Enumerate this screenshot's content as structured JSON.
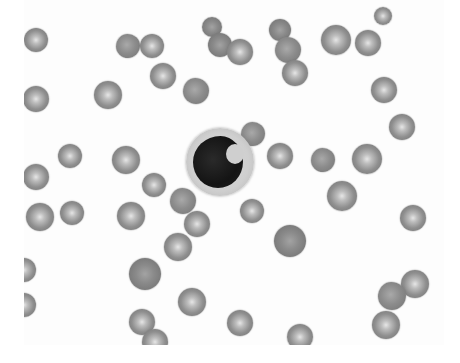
{
  "image": {
    "description": "Grayscale peripheral blood smear micrograph showing a central monocyte with kidney-shaped nucleus surrounded by red blood cells",
    "width": 460,
    "height": 363,
    "field": {
      "x": 24,
      "y": 0,
      "w": 420,
      "h": 345
    },
    "colors": {
      "background": "#ffffff",
      "rbc_mid": "#8f8f8f",
      "rbc_center": "#e6e6e6",
      "nucleus": "#141414",
      "cytoplasm": "#cfcfcf"
    }
  },
  "monocyte": {
    "cx": 220,
    "cy": 162,
    "r": 34
  },
  "red_blood_cells": [
    {
      "cx": 36,
      "cy": 40,
      "r": 12,
      "type": "normal"
    },
    {
      "cx": 128,
      "cy": 46,
      "r": 12,
      "type": "crenated"
    },
    {
      "cx": 152,
      "cy": 46,
      "r": 12,
      "type": "normal"
    },
    {
      "cx": 212,
      "cy": 27,
      "r": 10,
      "type": "dark"
    },
    {
      "cx": 220,
      "cy": 45,
      "r": 12,
      "type": "dark"
    },
    {
      "cx": 240,
      "cy": 52,
      "r": 13,
      "type": "normal"
    },
    {
      "cx": 280,
      "cy": 30,
      "r": 11,
      "type": "dark"
    },
    {
      "cx": 288,
      "cy": 50,
      "r": 13,
      "type": "crenated"
    },
    {
      "cx": 295,
      "cy": 73,
      "r": 13,
      "type": "normal"
    },
    {
      "cx": 336,
      "cy": 40,
      "r": 15,
      "type": "normal"
    },
    {
      "cx": 368,
      "cy": 43,
      "r": 13,
      "type": "normal"
    },
    {
      "cx": 384,
      "cy": 90,
      "r": 13,
      "type": "normal"
    },
    {
      "cx": 163,
      "cy": 76,
      "r": 13,
      "type": "normal"
    },
    {
      "cx": 196,
      "cy": 91,
      "r": 13,
      "type": "crenated"
    },
    {
      "cx": 108,
      "cy": 95,
      "r": 14,
      "type": "normal"
    },
    {
      "cx": 36,
      "cy": 99,
      "r": 13,
      "type": "normal"
    },
    {
      "cx": 402,
      "cy": 127,
      "r": 13,
      "type": "normal"
    },
    {
      "cx": 70,
      "cy": 156,
      "r": 12,
      "type": "normal"
    },
    {
      "cx": 126,
      "cy": 160,
      "r": 14,
      "type": "normal"
    },
    {
      "cx": 36,
      "cy": 177,
      "r": 13,
      "type": "normal"
    },
    {
      "cx": 253,
      "cy": 134,
      "r": 12,
      "type": "crenated"
    },
    {
      "cx": 280,
      "cy": 156,
      "r": 13,
      "type": "normal"
    },
    {
      "cx": 323,
      "cy": 160,
      "r": 12,
      "type": "crenated"
    },
    {
      "cx": 367,
      "cy": 159,
      "r": 15,
      "type": "normal"
    },
    {
      "cx": 154,
      "cy": 185,
      "r": 12,
      "type": "normal"
    },
    {
      "cx": 183,
      "cy": 201,
      "r": 13,
      "type": "crenated"
    },
    {
      "cx": 197,
      "cy": 224,
      "r": 13,
      "type": "normal"
    },
    {
      "cx": 342,
      "cy": 196,
      "r": 15,
      "type": "normal"
    },
    {
      "cx": 40,
      "cy": 217,
      "r": 14,
      "type": "normal"
    },
    {
      "cx": 72,
      "cy": 213,
      "r": 12,
      "type": "normal"
    },
    {
      "cx": 131,
      "cy": 216,
      "r": 14,
      "type": "normal"
    },
    {
      "cx": 252,
      "cy": 211,
      "r": 12,
      "type": "normal"
    },
    {
      "cx": 413,
      "cy": 218,
      "r": 13,
      "type": "normal"
    },
    {
      "cx": 178,
      "cy": 247,
      "r": 14,
      "type": "normal"
    },
    {
      "cx": 290,
      "cy": 241,
      "r": 16,
      "type": "dark"
    },
    {
      "cx": 24,
      "cy": 270,
      "r": 12,
      "type": "normal"
    },
    {
      "cx": 145,
      "cy": 274,
      "r": 16,
      "type": "dark"
    },
    {
      "cx": 415,
      "cy": 284,
      "r": 14,
      "type": "normal"
    },
    {
      "cx": 392,
      "cy": 296,
      "r": 14,
      "type": "crenated"
    },
    {
      "cx": 24,
      "cy": 305,
      "r": 12,
      "type": "normal"
    },
    {
      "cx": 192,
      "cy": 302,
      "r": 14,
      "type": "normal"
    },
    {
      "cx": 386,
      "cy": 325,
      "r": 14,
      "type": "normal"
    },
    {
      "cx": 142,
      "cy": 322,
      "r": 13,
      "type": "normal"
    },
    {
      "cx": 240,
      "cy": 323,
      "r": 13,
      "type": "normal"
    },
    {
      "cx": 155,
      "cy": 342,
      "r": 13,
      "type": "normal"
    },
    {
      "cx": 300,
      "cy": 337,
      "r": 13,
      "type": "normal"
    },
    {
      "cx": 383,
      "cy": 16,
      "r": 9,
      "type": "normal"
    }
  ]
}
